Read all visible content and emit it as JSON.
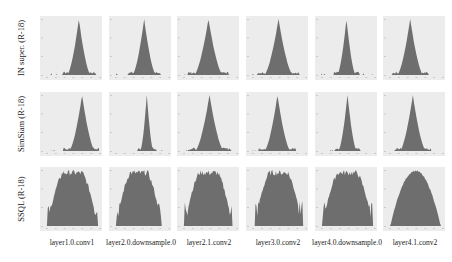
{
  "figure": {
    "rows": [
      {
        "label": "IN super. (R-18)",
        "shape": "sharp"
      },
      {
        "label": "SimSiam (R-18)",
        "shape": "sharp"
      },
      {
        "label": "SSQL (R-18)",
        "shape": "broad"
      }
    ],
    "columns": [
      {
        "label": "layer1.0.conv1"
      },
      {
        "label": "layer2.0.downsample.0"
      },
      {
        "label": "layer2.1.conv2"
      },
      {
        "label": "layer3.0.conv2"
      },
      {
        "label": "layer4.0.downsample.0"
      },
      {
        "label": "layer4.1.conv2"
      }
    ],
    "colors": {
      "panel_bg": "#ececec",
      "histogram": "#6e6e6e"
    }
  },
  "chart_data": {
    "type": "heatmap",
    "title": "",
    "row_labels": [
      "IN super. (R-18)",
      "SimSiam (R-18)",
      "SSQL (R-18)"
    ],
    "col_labels": [
      "layer1.0.conv1",
      "layer2.0.downsample.0",
      "layer2.1.conv2",
      "layer3.0.conv2",
      "layer4.0.downsample.0",
      "layer4.1.conv2"
    ],
    "panels": [
      {
        "row": 0,
        "col": 0,
        "shape": "sharp-peak",
        "peak_pos": 0.62,
        "width": 0.45
      },
      {
        "row": 0,
        "col": 1,
        "shape": "sharp-peak",
        "peak_pos": 0.55,
        "width": 0.45
      },
      {
        "row": 0,
        "col": 2,
        "shape": "sharp-peak",
        "peak_pos": 0.48,
        "width": 0.55
      },
      {
        "row": 0,
        "col": 3,
        "shape": "sharp-peak",
        "peak_pos": 0.5,
        "width": 0.55
      },
      {
        "row": 0,
        "col": 4,
        "shape": "sharp-peak",
        "peak_pos": 0.48,
        "width": 0.35
      },
      {
        "row": 0,
        "col": 5,
        "shape": "sharp-peak",
        "peak_pos": 0.4,
        "width": 0.5
      },
      {
        "row": 1,
        "col": 0,
        "shape": "sharp-peak",
        "peak_pos": 0.68,
        "width": 0.5
      },
      {
        "row": 1,
        "col": 1,
        "shape": "sharp-peak",
        "peak_pos": 0.6,
        "width": 0.25
      },
      {
        "row": 1,
        "col": 2,
        "shape": "sharp-peak",
        "peak_pos": 0.5,
        "width": 0.55
      },
      {
        "row": 1,
        "col": 3,
        "shape": "sharp-peak",
        "peak_pos": 0.48,
        "width": 0.5
      },
      {
        "row": 1,
        "col": 4,
        "shape": "sharp-peak",
        "peak_pos": 0.5,
        "width": 0.35
      },
      {
        "row": 1,
        "col": 5,
        "shape": "sharp-peak",
        "peak_pos": 0.45,
        "width": 0.5
      },
      {
        "row": 2,
        "col": 0,
        "shape": "broad-plateau",
        "peak_pos": 0.5,
        "width": 0.95
      },
      {
        "row": 2,
        "col": 1,
        "shape": "broad-plateau",
        "peak_pos": 0.45,
        "width": 0.85
      },
      {
        "row": 2,
        "col": 2,
        "shape": "broad-plateau",
        "peak_pos": 0.48,
        "width": 0.9
      },
      {
        "row": 2,
        "col": 3,
        "shape": "broad-plateau",
        "peak_pos": 0.5,
        "width": 0.9
      },
      {
        "row": 2,
        "col": 4,
        "shape": "broad-plateau",
        "peak_pos": 0.5,
        "width": 0.95
      },
      {
        "row": 2,
        "col": 5,
        "shape": "broad-dome",
        "peak_pos": 0.5,
        "width": 0.95
      }
    ],
    "grid": false,
    "legend": "none"
  }
}
